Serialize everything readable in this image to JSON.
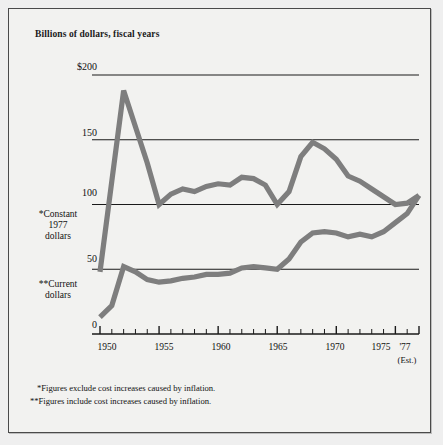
{
  "figure": {
    "title": "Billions of dollars, fiscal years",
    "background_color": "#f2f2f0",
    "line_color": "#7e7e7e",
    "axis_color": "#1a1a1a"
  },
  "series_labels": {
    "constant": "*Constant\n1977\ndollars",
    "constant_line1": "*Constant",
    "constant_line2": "1977",
    "constant_line3": "dollars",
    "current_line1": "**Current",
    "current_line2": "dollars"
  },
  "axis": {
    "y_ticks": [
      "$200",
      "150",
      "100",
      "50",
      "0"
    ],
    "y_values": [
      200,
      150,
      100,
      50,
      0
    ],
    "x_ticks": [
      "1950",
      "1955",
      "1960",
      "1965",
      "1970",
      "1975",
      "'77"
    ],
    "x_tick_values": [
      1950,
      1955,
      1960,
      1965,
      1970,
      1975,
      1977
    ],
    "x_estimate_note": "(Est.)"
  },
  "footnotes": [
    "*Figures exclude cost increases caused by inflation.",
    "**Figures include cost increases caused by inflation."
  ],
  "chart_data": {
    "type": "line",
    "title": "Billions of dollars, fiscal years",
    "xlabel": "",
    "ylabel": "Billions of dollars",
    "xlim": [
      1950,
      1977
    ],
    "ylim": [
      0,
      200
    ],
    "grid": true,
    "legend": "inline-left-labels",
    "x": [
      1950,
      1951,
      1952,
      1953,
      1954,
      1955,
      1956,
      1957,
      1958,
      1959,
      1960,
      1961,
      1962,
      1963,
      1964,
      1965,
      1966,
      1967,
      1968,
      1969,
      1970,
      1971,
      1972,
      1973,
      1974,
      1975,
      1976,
      1977
    ],
    "series": [
      {
        "name": "*Constant 1977 dollars",
        "values": [
          48,
          118,
          188,
          160,
          132,
          100,
          108,
          112,
          110,
          114,
          116,
          115,
          121,
          120,
          115,
          100,
          110,
          137,
          148,
          143,
          135,
          122,
          118,
          112,
          106,
          100,
          101,
          107
        ]
      },
      {
        "name": "**Current dollars",
        "values": [
          13,
          22,
          52,
          48,
          42,
          40,
          41,
          43,
          44,
          46,
          46,
          47,
          51,
          52,
          51,
          50,
          58,
          71,
          78,
          79,
          78,
          75,
          77,
          75,
          79,
          86,
          93,
          107
        ]
      }
    ]
  }
}
